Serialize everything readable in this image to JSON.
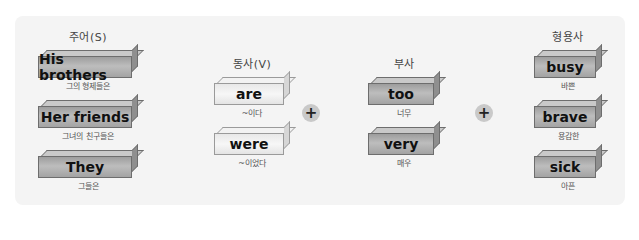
{
  "columns": {
    "subject": {
      "heading": "주어(S)",
      "items": [
        {
          "word": "His brothers",
          "gloss": "그의 형제들은"
        },
        {
          "word": "Her friends",
          "gloss": "그녀의 친구들은"
        },
        {
          "word": "They",
          "gloss": "그들은"
        }
      ]
    },
    "verb": {
      "heading": "동사(V)",
      "items": [
        {
          "word": "are",
          "gloss": "~이다"
        },
        {
          "word": "were",
          "gloss": "~이었다"
        }
      ]
    },
    "adverb": {
      "heading": "부사",
      "items": [
        {
          "word": "too",
          "gloss": "너무"
        },
        {
          "word": "very",
          "gloss": "매우"
        }
      ]
    },
    "adjective": {
      "heading": "형용사",
      "items": [
        {
          "word": "busy",
          "gloss": "바쁜"
        },
        {
          "word": "brave",
          "gloss": "용감한"
        },
        {
          "word": "sick",
          "gloss": "아픈"
        }
      ]
    }
  },
  "operators": [
    "+",
    "+"
  ],
  "colors": {
    "panel": "#f4f4f4",
    "block_dark": "#b0b0b0",
    "block_light": "#f0f0f0",
    "plus_circle": "#c9c9c9"
  }
}
